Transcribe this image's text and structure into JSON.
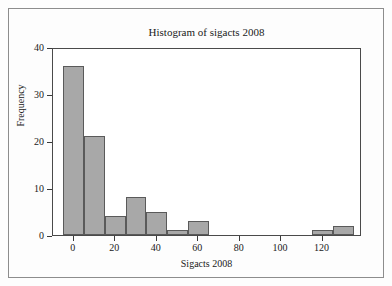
{
  "figure": {
    "background_color": "#fdfdfd",
    "frame_color": "#8d8d8d",
    "plot_background_color": "#ffffff",
    "plot_border_color": "#4a4a4a"
  },
  "chart_data": {
    "type": "bar",
    "title": "Histogram of sigacts 2008",
    "xlabel": "Sigacts 2008",
    "ylabel": "Frequency",
    "bar_color": "#a8a8a8",
    "bar_edge_color": "#5a5a5a",
    "grid": false,
    "legend": "none",
    "xlim": [
      -10,
      139
    ],
    "ylim": [
      0,
      40
    ],
    "xticks": [
      0,
      20,
      40,
      60,
      80,
      100,
      120
    ],
    "xtick_labels": [
      "0",
      "20",
      "40",
      "60",
      "80",
      "100",
      "120"
    ],
    "yticks": [
      0,
      10,
      20,
      30,
      40
    ],
    "ytick_labels": [
      "0",
      "10",
      "20",
      "30",
      "40"
    ],
    "bin_width": 10,
    "bin_edges": [
      -5,
      5,
      15,
      25,
      35,
      45,
      55,
      65,
      75,
      85,
      95,
      105,
      115,
      125,
      135
    ],
    "categories": [
      "-5 to 5",
      "5 to 15",
      "15 to 25",
      "25 to 35",
      "35 to 45",
      "45 to 55",
      "55 to 65",
      "65 to 75",
      "75 to 85",
      "85 to 95",
      "95 to 105",
      "105 to 115",
      "115 to 125",
      "125 to 135"
    ],
    "values": [
      36,
      21,
      4,
      8,
      5,
      1,
      3,
      0,
      0,
      0,
      0,
      0,
      1,
      2
    ]
  }
}
